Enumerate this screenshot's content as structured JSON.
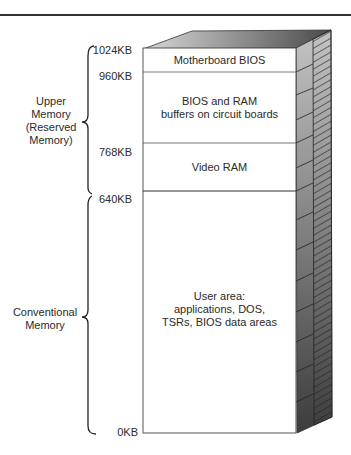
{
  "diagram": {
    "addresses": [
      "1024KB",
      "960KB",
      "768KB",
      "640KB",
      "0KB"
    ],
    "regions": [
      {
        "name": "motherboard-bios",
        "lines": [
          "Motherboard BIOS"
        ]
      },
      {
        "name": "bios-ram-buffers",
        "lines": [
          "BIOS and RAM",
          "buffers on circuit boards"
        ]
      },
      {
        "name": "video-ram",
        "lines": [
          "Video RAM"
        ]
      },
      {
        "name": "user-area",
        "lines": [
          "User area:",
          "applications, DOS,",
          "TSRs, BIOS data areas"
        ]
      }
    ],
    "groups": [
      {
        "name": "upper-memory",
        "lines": [
          "Upper",
          "Memory",
          "(Reserved",
          "Memory)"
        ]
      },
      {
        "name": "conventional-memory",
        "lines": [
          "Conventional",
          "Memory"
        ]
      }
    ]
  }
}
